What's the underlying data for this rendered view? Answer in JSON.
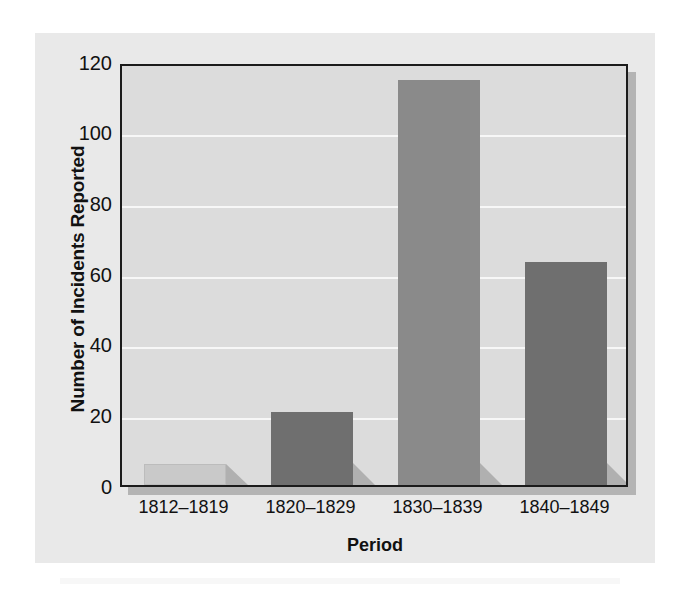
{
  "chart_data": {
    "type": "bar",
    "title": "",
    "subtitle": "",
    "xlabel": "Period",
    "ylabel": "Number of Incidents Reported",
    "categories": [
      "1812–1819",
      "1820–1829",
      "1830–1839",
      "1840–1849"
    ],
    "values": [
      6,
      21,
      116,
      64
    ],
    "series": [
      {
        "name": "Number of Incidents Reported",
        "values": [
          6,
          21,
          116,
          64
        ]
      }
    ],
    "ylim": [
      0,
      120
    ],
    "yticks": [
      120,
      100,
      80,
      60,
      40,
      20,
      0
    ],
    "ytick_labels": [
      "120",
      "100",
      "80",
      "60",
      "40",
      "20",
      "0"
    ],
    "xtick_labels": [
      "1812–1819",
      "1820–1829",
      "1830–1839",
      "1840–1849"
    ],
    "grid": "horizontal",
    "legend": "none",
    "legend_position": "none",
    "bar_colors": [
      "#c9c9c9",
      "#6f6f6f",
      "#8a8a8a",
      "#6f6f6f"
    ],
    "colors": {
      "plot_background": "#dcdcdc",
      "panel_background": "#e9e9e9",
      "page_background": "#ffffff",
      "gridline": "#f7f7f7",
      "frame": "#1b1b1b",
      "bar_shadow": "#b0b0b0",
      "text": "#111111"
    }
  }
}
